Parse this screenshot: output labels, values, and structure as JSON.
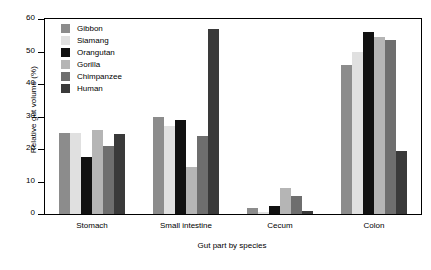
{
  "chart_data": {
    "type": "bar",
    "title": "",
    "xlabel": "Gut part by species",
    "ylabel": "Relative gut volume (%)",
    "categories": [
      "Stomach",
      "Small intestine",
      "Cecum",
      "Colon"
    ],
    "ylim": [
      0,
      60
    ],
    "yticks": [
      0,
      10,
      20,
      30,
      40,
      50,
      60
    ],
    "grid": false,
    "legend_position": "upper left (inside axes)",
    "series": [
      {
        "name": "Gibbon",
        "color": "#8c8c8c",
        "values": [
          25.0,
          30.0,
          2.0,
          46.0
        ]
      },
      {
        "name": "Siamang",
        "color": "#e0e0e0",
        "values": [
          25.0,
          27.0,
          0.5,
          50.0
        ]
      },
      {
        "name": "Orangutan",
        "color": "#111111",
        "values": [
          17.5,
          29.0,
          2.5,
          56.0
        ]
      },
      {
        "name": "Gorilla",
        "color": "#b5b5b5",
        "values": [
          26.0,
          14.5,
          8.0,
          54.5
        ]
      },
      {
        "name": "Chimpanzee",
        "color": "#6e6e6e",
        "values": [
          21.0,
          24.0,
          5.5,
          53.5
        ]
      },
      {
        "name": "Human",
        "color": "#3a3a3a",
        "values": [
          24.5,
          57.0,
          1.0,
          19.5
        ]
      }
    ]
  },
  "axes": {
    "y_tick_labels": [
      "0",
      "10",
      "20",
      "30",
      "40",
      "50",
      "60"
    ]
  }
}
